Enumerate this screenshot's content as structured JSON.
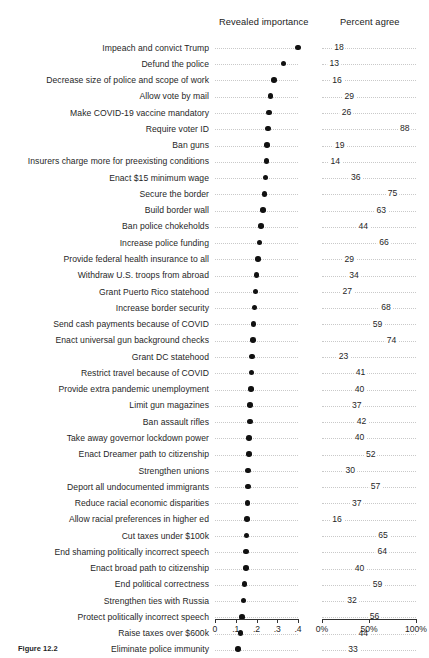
{
  "figure": {
    "caption": "Figure 12.2",
    "headers": {
      "importance": "Revealed importance",
      "percent": "Percent agree"
    }
  },
  "chart_data": {
    "type": "scatter",
    "title": "",
    "subtitle": "",
    "panels": [
      {
        "name": "revealed-importance",
        "label": "Revealed importance",
        "xlabel": "",
        "xlim": [
          0,
          0.4
        ],
        "ticks": [
          {
            "value": 0,
            "label": "0"
          },
          {
            "value": 0.1,
            "label": ".1"
          },
          {
            "value": 0.2,
            "label": ".2"
          },
          {
            "value": 0.3,
            "label": ".3"
          },
          {
            "value": 0.4,
            "label": ".4"
          }
        ],
        "grid": "dotted"
      },
      {
        "name": "percent-agree",
        "label": "Percent agree",
        "xlabel": "",
        "xlim": [
          0,
          100
        ],
        "ticks": [
          {
            "value": 0,
            "label": "0%"
          },
          {
            "value": 50,
            "label": "50%"
          },
          {
            "value": 100,
            "label": "100%"
          }
        ],
        "grid": "dotted"
      }
    ],
    "categories": [
      "Impeach and convict Trump",
      "Defund the police",
      "Decrease size of police and scope of work",
      "Allow vote by mail",
      "Make COVID-19 vaccine mandatory",
      "Require voter ID",
      "Ban guns",
      "Insurers charge more for preexisting conditions",
      "Enact $15 minimum wage",
      "Secure the border",
      "Build border wall",
      "Ban police chokeholds",
      "Increase police funding",
      "Provide federal health insurance to all",
      "Withdraw U.S. troops from abroad",
      "Grant Puerto Rico statehood",
      "Increase border security",
      "Send cash payments because of COVID",
      "Enact universal gun background checks",
      "Grant DC statehood",
      "Restrict travel because of COVID",
      "Provide extra pandemic unemployment",
      "Limit gun magazines",
      "Ban assault rifles",
      "Take away governor lockdown power",
      "Enact Dreamer path to citizenship",
      "Strengthen unions",
      "Deport all undocumented immigrants",
      "Reduce racial economic disparities",
      "Allow racial preferences in higher ed",
      "Cut taxes under $100k",
      "End shaming politically incorrect speech",
      "Enact broad path to citizenship",
      "End political correctness",
      "Strengthen ties with Russia",
      "Protect politically incorrect speech",
      "Raise taxes over $600k",
      "Eliminate police immunity"
    ],
    "series": [
      {
        "name": "Revealed importance",
        "values": [
          0.4,
          0.33,
          0.283,
          0.268,
          0.26,
          0.255,
          0.25,
          0.248,
          0.243,
          0.238,
          0.23,
          0.222,
          0.214,
          0.207,
          0.2,
          0.196,
          0.191,
          0.186,
          0.183,
          0.178,
          0.176,
          0.173,
          0.17,
          0.168,
          0.165,
          0.163,
          0.16,
          0.158,
          0.156,
          0.154,
          0.152,
          0.15,
          0.148,
          0.143,
          0.137,
          0.13,
          0.122,
          0.112
        ]
      },
      {
        "name": "Percent agree",
        "values": [
          18,
          13,
          16,
          29,
          26,
          88,
          19,
          14,
          36,
          75,
          63,
          44,
          66,
          29,
          34,
          27,
          68,
          59,
          74,
          23,
          41,
          40,
          37,
          42,
          40,
          52,
          30,
          57,
          37,
          16,
          65,
          64,
          40,
          59,
          32,
          56,
          44,
          33
        ]
      }
    ]
  }
}
